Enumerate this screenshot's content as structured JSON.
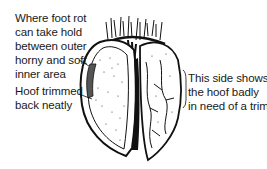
{
  "diagram": {
    "labels": {
      "foot_rot": [
        "Where foot rot",
        "can take hold",
        "between outer",
        "horny and soft",
        "inner area"
      ],
      "trimmed": [
        "Hoof trimmed",
        "back neatly"
      ],
      "untrimmed": [
        "This side shows",
        "the hoof badly",
        "in need of a trim"
      ]
    }
  }
}
